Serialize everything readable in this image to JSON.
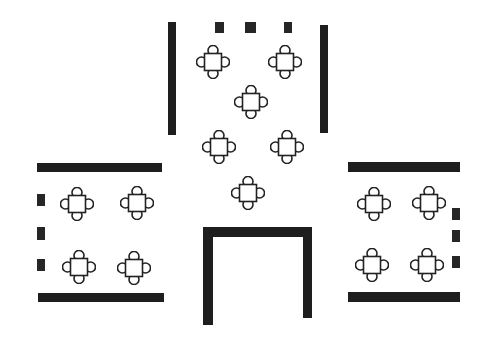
{
  "diagram": {
    "type": "floor-plan",
    "colors": {
      "wall": "#1e1e1e",
      "table_stroke": "#222222",
      "background": "#ffffff"
    },
    "walls": [
      {
        "id": "top-left-wall",
        "x": 168,
        "y": 22,
        "w": 8,
        "h": 113
      },
      {
        "id": "top-right-wall",
        "x": 320,
        "y": 25,
        "w": 8,
        "h": 108
      },
      {
        "id": "left-top-wall",
        "x": 37,
        "y": 163,
        "w": 125,
        "h": 9
      },
      {
        "id": "left-bottom-wall",
        "x": 38,
        "y": 293,
        "w": 126,
        "h": 9
      },
      {
        "id": "right-top-wall",
        "x": 348,
        "y": 162,
        "w": 112,
        "h": 10
      },
      {
        "id": "right-bottom-wall",
        "x": 348,
        "y": 292,
        "w": 112,
        "h": 10
      },
      {
        "id": "bottom-u-left",
        "x": 203,
        "y": 227,
        "w": 10,
        "h": 98
      },
      {
        "id": "bottom-u-top",
        "x": 203,
        "y": 227,
        "w": 109,
        "h": 10
      },
      {
        "id": "bottom-u-right",
        "x": 303,
        "y": 227,
        "w": 9,
        "h": 91
      }
    ],
    "blocks": [
      {
        "id": "top-block-1",
        "x": 215,
        "y": 22,
        "w": 9,
        "h": 11
      },
      {
        "id": "top-block-2",
        "x": 245,
        "y": 22,
        "w": 11,
        "h": 11
      },
      {
        "id": "top-block-3",
        "x": 284,
        "y": 22,
        "w": 8,
        "h": 11
      },
      {
        "id": "left-block-1",
        "x": 37,
        "y": 194,
        "w": 8,
        "h": 12
      },
      {
        "id": "left-block-2",
        "x": 37,
        "y": 227,
        "w": 8,
        "h": 13
      },
      {
        "id": "left-block-3",
        "x": 37,
        "y": 259,
        "w": 8,
        "h": 12
      },
      {
        "id": "right-block-1",
        "x": 452,
        "y": 208,
        "w": 8,
        "h": 12
      },
      {
        "id": "right-block-2",
        "x": 452,
        "y": 230,
        "w": 8,
        "h": 12
      },
      {
        "id": "right-block-3",
        "x": 452,
        "y": 256,
        "w": 8,
        "h": 12
      }
    ],
    "tables": [
      {
        "id": "table-1",
        "cx": 213,
        "cy": 62,
        "chairs": 4
      },
      {
        "id": "table-2",
        "cx": 285,
        "cy": 62,
        "chairs": 4
      },
      {
        "id": "table-3",
        "cx": 251,
        "cy": 102,
        "chairs": 4
      },
      {
        "id": "table-4",
        "cx": 219,
        "cy": 147,
        "chairs": 4
      },
      {
        "id": "table-5",
        "cx": 287,
        "cy": 147,
        "chairs": 4
      },
      {
        "id": "table-6",
        "cx": 248,
        "cy": 193,
        "chairs": 4
      },
      {
        "id": "table-7",
        "cx": 77,
        "cy": 204,
        "chairs": 4
      },
      {
        "id": "table-8",
        "cx": 137,
        "cy": 203,
        "chairs": 4
      },
      {
        "id": "table-9",
        "cx": 79,
        "cy": 267,
        "chairs": 4
      },
      {
        "id": "table-10",
        "cx": 134,
        "cy": 268,
        "chairs": 4
      },
      {
        "id": "table-11",
        "cx": 374,
        "cy": 204,
        "chairs": 4
      },
      {
        "id": "table-12",
        "cx": 429,
        "cy": 203,
        "chairs": 4
      },
      {
        "id": "table-13",
        "cx": 372,
        "cy": 265,
        "chairs": 4
      },
      {
        "id": "table-14",
        "cx": 427,
        "cy": 265,
        "chairs": 4
      }
    ]
  }
}
